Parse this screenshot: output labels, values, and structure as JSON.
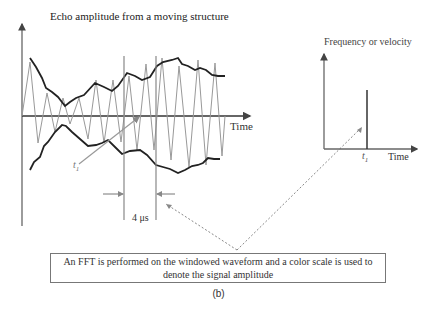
{
  "left_panel": {
    "title": "Echo amplitude from a moving structure",
    "x_axis_label": "Time",
    "marker_label": "t",
    "marker_subscript": "1",
    "window_width_label": "4 μs"
  },
  "right_panel": {
    "y_axis_label": "Frequency or velocity",
    "x_axis_label": "Time",
    "marker_label": "t",
    "marker_subscript": "1"
  },
  "caption": {
    "line1": "An  FFT is performed on the windowed waveform and a color scale is used to",
    "line2": "denote the signal amplitude"
  },
  "panel_label": "(b)",
  "colors": {
    "envelope": "#222222",
    "waveform": "#999999",
    "axis": "#555555",
    "window_lines": "#888888",
    "dashed_arrow": "#888888"
  }
}
